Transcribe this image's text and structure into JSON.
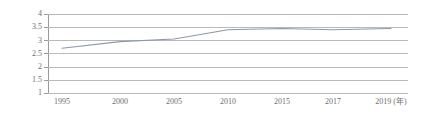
{
  "chart_data": {
    "type": "line",
    "title": "",
    "subtitle": "",
    "xlabel": "(年)",
    "ylabel": "",
    "grid": true,
    "legend": false,
    "legend_position": "none",
    "xlim": [
      1995,
      2019
    ],
    "ylim": [
      1,
      4
    ],
    "y_ticks": [
      "4",
      "3.5",
      "3",
      "2.5",
      "2",
      "1.5",
      "1"
    ],
    "y_tick_values": [
      4,
      3.5,
      3,
      2.5,
      2,
      1.5,
      1
    ],
    "x_ticks": [
      "1995",
      "2000",
      "2005",
      "2010",
      "2015",
      "2017",
      "2019 (年)"
    ],
    "x_tick_values": [
      1995,
      2000,
      2005,
      2010,
      2015,
      2017,
      2019
    ],
    "categories": [
      1995,
      2000,
      2005,
      2010,
      2015,
      2017,
      2019
    ],
    "values": [
      2.7,
      2.95,
      3.05,
      3.4,
      3.45,
      3.4,
      3.45
    ],
    "series": [
      {
        "name": "series-1",
        "values": [
          2.7,
          2.95,
          3.05,
          3.4,
          3.45,
          3.4,
          3.45
        ],
        "color": "#8c99a6"
      }
    ],
    "annotations": []
  },
  "style": {
    "line_color": "#8c99a6",
    "grid_color": "#b9b9b9",
    "axis_color": "#9a9a9a",
    "text_color": "#6e6e6e",
    "background": "#ffffff"
  }
}
